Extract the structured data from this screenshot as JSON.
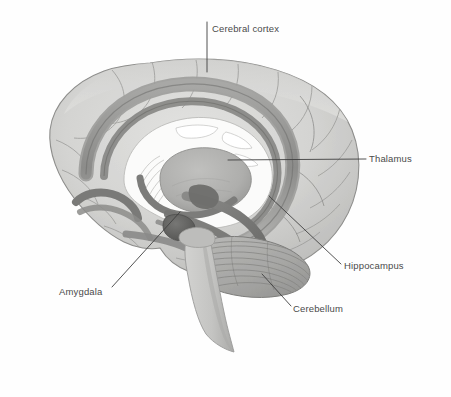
{
  "figure": {
    "kind": "anatomical-illustration",
    "style": "grayscale pencil / watercolor rendering",
    "background_color": "#fefefe",
    "ink_color": "#4a4a4a",
    "width": 451,
    "height": 397
  },
  "labels": {
    "cerebral_cortex": "Cerebral cortex",
    "thalamus": "Thalamus",
    "hippocampus": "Hippocampus",
    "amygdala": "Amygdala",
    "cerebellum": "Cerebellum"
  },
  "annotations": [
    {
      "id": "cerebral-cortex",
      "label": "Cerebral cortex",
      "text_x": 212,
      "text_y": 29,
      "leader": {
        "x1": 207,
        "y1": 22,
        "x2": 207,
        "y2": 72
      },
      "target": "outer folded surface at the top of the cerebrum"
    },
    {
      "id": "thalamus",
      "label": "Thalamus",
      "text_x": 369,
      "text_y": 159,
      "leader": {
        "x1": 366,
        "y1": 159,
        "x2": 228,
        "y2": 160
      },
      "target": "central oval gray mass deep in the cerebrum"
    },
    {
      "id": "hippocampus",
      "label": "Hippocampus",
      "text_x": 344,
      "text_y": 266,
      "leader": {
        "x1": 341,
        "y1": 264,
        "x2": 269,
        "y2": 196
      },
      "target": "curved band below and behind the thalamus"
    },
    {
      "id": "amygdala",
      "label": "Amygdala",
      "text_x": 59,
      "text_y": 292,
      "leader": {
        "x1": 112,
        "y1": 287,
        "x2": 180,
        "y2": 212
      },
      "target": "small dark almond-shaped nucleus at the temporal tip"
    },
    {
      "id": "cerebellum",
      "label": "Cerebellum",
      "text_x": 293,
      "text_y": 309,
      "leader": {
        "x1": 291,
        "y1": 306,
        "x2": 262,
        "y2": 274
      },
      "target": "striated folia mass behind and below the brainstem"
    }
  ],
  "palette": {
    "cortex_fill": "#d6d6d4",
    "cortex_shade": "#bdbdbb",
    "cortex_outline": "#8e8e8c",
    "corpus_callosum": "#9a9a98",
    "corpus_callosum_dark": "#787876",
    "ventricle_white": "#fbfbfa",
    "thalamus_fill": "#b0b0ae",
    "hippocampus_dark": "#6f6f6d",
    "amygdala_dark": "#5e5e5c",
    "cerebellum_fill": "#aeaeac",
    "brainstem_fill": "#c8c8c6",
    "leader_line": "#3f3f3f",
    "text": "#4a4a4a"
  }
}
